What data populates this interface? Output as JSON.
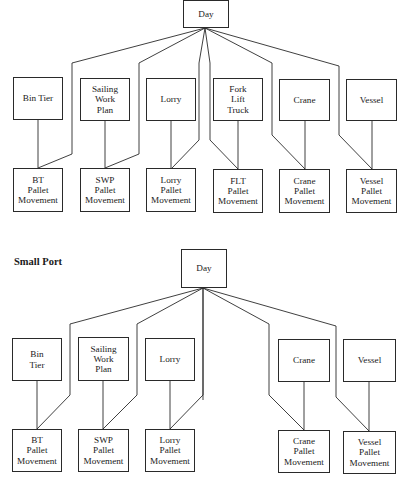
{
  "diagrams": [
    {
      "title": "",
      "root": {
        "label": "Day",
        "box": [
          183,
          0,
          46,
          28
        ]
      },
      "nodes": [
        {
          "label": "Bin Tier",
          "box": [
            13,
            77,
            50,
            43
          ],
          "child": {
            "label": "BT\nPallet\nMovement",
            "box": [
              13,
              168,
              50,
              44
            ]
          }
        },
        {
          "label": "Sailing\nWork\nPlan",
          "box": [
            80,
            78,
            50,
            43
          ],
          "child": {
            "label": "SWP\nPallet\nMovement",
            "box": [
              80,
              168,
              50,
              44
            ]
          }
        },
        {
          "label": "Lorry",
          "box": [
            146,
            78,
            50,
            43
          ],
          "child": {
            "label": "Lorry\nPallet\nMovement",
            "box": [
              146,
              168,
              50,
              44
            ]
          }
        },
        {
          "label": "Fork\nLift\nTruck",
          "box": [
            213,
            78,
            50,
            43
          ],
          "child": {
            "label": "FLT\nPallet\nMovement",
            "box": [
              213,
              169,
              50,
              44
            ]
          }
        },
        {
          "label": "Crane",
          "box": [
            279,
            79,
            51,
            42
          ],
          "child": {
            "label": "Crane\nPallet\nMovement",
            "box": [
              279,
              169,
              51,
              44
            ]
          }
        },
        {
          "label": "Vessel",
          "box": [
            346,
            79,
            51,
            42
          ],
          "child": {
            "label": "Vessel\nPallet\nMovement",
            "box": [
              346,
              169,
              51,
              44
            ]
          }
        }
      ]
    },
    {
      "title": "Small Port",
      "root": {
        "label": "Day",
        "box": [
          181,
          249,
          46,
          39
        ]
      },
      "nodes": [
        {
          "label": "Bin\nTier",
          "box": [
            12,
            338,
            50,
            43
          ],
          "child": {
            "label": "BT\nPallet\nMovement",
            "box": [
              12,
              429,
              50,
              43
            ]
          }
        },
        {
          "label": "Sailing\nWork\nPlan",
          "box": [
            78,
            337,
            51,
            44
          ],
          "child": {
            "label": "SWP\nPallet\nMovement",
            "box": [
              78,
              429,
              51,
              43
            ]
          }
        },
        {
          "label": "Lorry",
          "box": [
            145,
            338,
            50,
            43
          ],
          "child": {
            "label": "Lorry\nPallet\nMovement",
            "box": [
              145,
              429,
              50,
              43
            ]
          }
        },
        {
          "label": "Crane",
          "box": [
            278,
            339,
            52,
            43
          ],
          "child": {
            "label": "Crane\nPallet\nMovement",
            "box": [
              278,
              430,
              52,
              43
            ]
          }
        },
        {
          "label": "Vessel",
          "box": [
            343,
            339,
            53,
            43
          ],
          "child": {
            "label": "Vessel\nPallet\nMovement",
            "box": [
              343,
              431,
              53,
              43
            ]
          }
        }
      ]
    }
  ],
  "footer": {
    "text": ""
  }
}
